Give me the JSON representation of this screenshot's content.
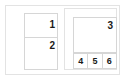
{
  "diagram": {
    "type": "wireframe-layout",
    "frame": {
      "border_color": "#e3e3e3",
      "background": "#ffffff"
    },
    "panels": [
      {
        "name": "left-panel",
        "border_color": "#d6d6d6",
        "regions": [
          {
            "id": "region-1",
            "label": "1",
            "align": "right"
          },
          {
            "id": "region-2",
            "label": "2",
            "align": "right"
          }
        ]
      },
      {
        "name": "right-panel",
        "border_color": "#e3e3e3",
        "regions": [
          {
            "id": "region-3",
            "label": "3",
            "align": "right"
          }
        ],
        "cells": [
          {
            "id": "cell-4",
            "label": "4"
          },
          {
            "id": "cell-5",
            "label": "5"
          },
          {
            "id": "cell-6",
            "label": "6"
          }
        ]
      }
    ],
    "label_color": "#1a1a1a"
  }
}
